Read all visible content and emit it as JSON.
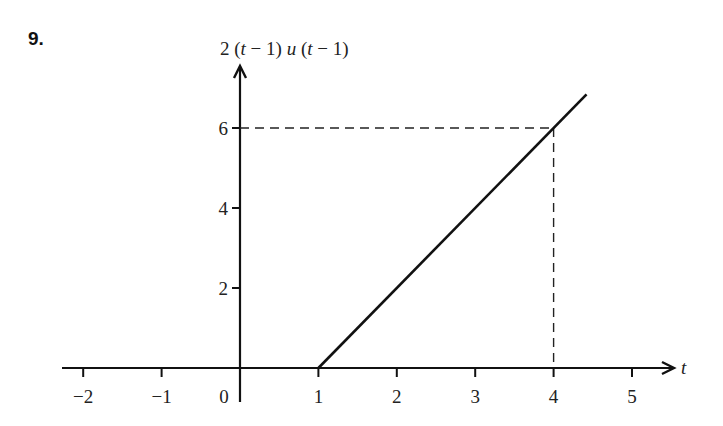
{
  "problem_number": "9.",
  "chart_data": {
    "type": "line",
    "title": "",
    "ylabel": "2 (t − 1) u (t − 1)",
    "xlabel": "t",
    "x_ticks": [
      -2,
      -1,
      0,
      1,
      2,
      3,
      4,
      5
    ],
    "x_tick_labels": [
      "−2",
      "−1",
      "0",
      "1",
      "2",
      "3",
      "4",
      "5"
    ],
    "y_ticks": [
      2,
      4,
      6
    ],
    "y_tick_labels": [
      "2",
      "4",
      "6"
    ],
    "xlim": [
      -2.3,
      5.6
    ],
    "ylim": [
      -0.5,
      7.2
    ],
    "series": [
      {
        "name": "2(t-1)u(t-1)",
        "x": [
          -2.3,
          1,
          4.42
        ],
        "y": [
          0,
          0,
          6.84
        ]
      }
    ],
    "annotations": [
      {
        "type": "dashed-guide",
        "from": [
          0,
          6
        ],
        "to": [
          4,
          6
        ]
      },
      {
        "type": "dashed-guide",
        "from": [
          4,
          6
        ],
        "to": [
          4,
          0
        ]
      }
    ],
    "grid": false,
    "legend": null
  }
}
